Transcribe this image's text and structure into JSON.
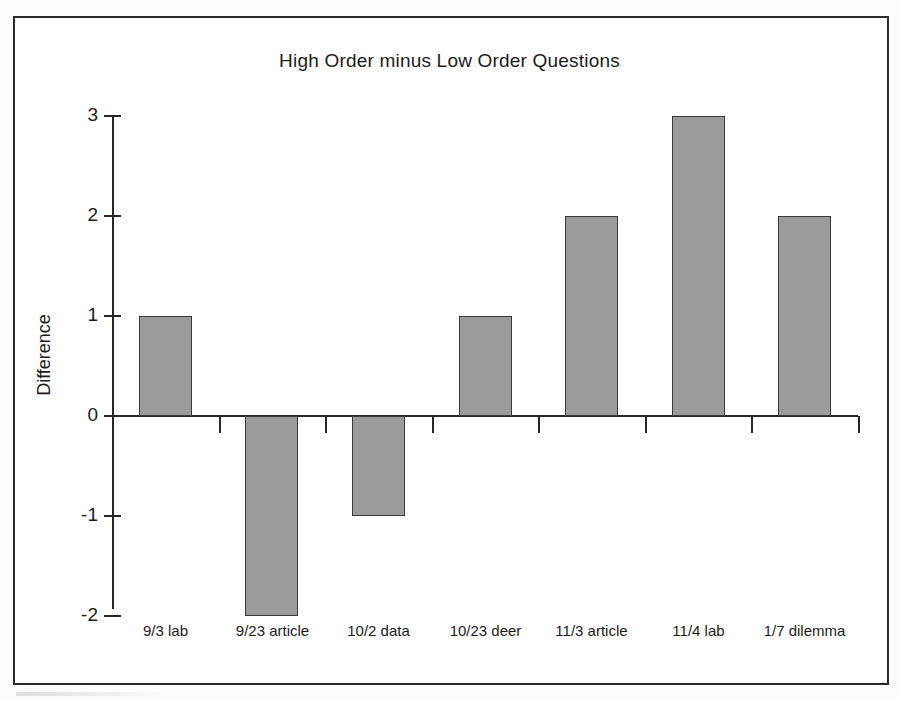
{
  "figure": {
    "frame_color": "#2b2b2b",
    "background": "#ffffff"
  },
  "chart_data": {
    "type": "bar",
    "title": "High Order minus Low Order Questions",
    "xlabel": "",
    "ylabel": "Difference",
    "categories": [
      "9/3 lab",
      "9/23 article",
      "10/2 data",
      "10/23 deer",
      "11/3 article",
      "11/4 lab",
      "1/7 dilemma"
    ],
    "values": [
      1,
      -2,
      -1,
      1,
      2,
      3,
      2
    ],
    "ytick_labels": [
      "3",
      "2",
      "1",
      "0",
      "-1",
      "-2"
    ],
    "ytick_values": [
      3,
      2,
      1,
      0,
      -1,
      -2
    ],
    "ylim": [
      -2,
      3
    ],
    "grid": false,
    "legend": "none",
    "bar_fill_color": "#9b9b9b",
    "bar_edge_color": "#3a3a3a",
    "axis_color": "#262626"
  }
}
